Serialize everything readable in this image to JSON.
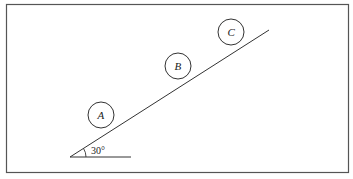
{
  "diagram": {
    "type": "incline-with-balls",
    "angle_label": "30°",
    "balls": [
      {
        "label": "A"
      },
      {
        "label": "B"
      },
      {
        "label": "C"
      }
    ],
    "colors": {
      "line": "#333333",
      "frame": "#555555",
      "background": "#ffffff"
    }
  }
}
